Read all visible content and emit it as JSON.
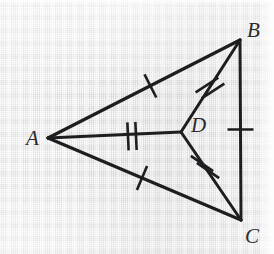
{
  "figure": {
    "kind": "geometry-diagram",
    "width": 274,
    "height": 254,
    "background_color": "#ececed",
    "stroke_color": "#1e1e21",
    "label_color": "#2b2b2e"
  },
  "points": {
    "A": {
      "label": "A",
      "x": 48,
      "y": 138,
      "label_x": 26,
      "label_y": 128
    },
    "B": {
      "label": "B",
      "x": 240,
      "y": 40,
      "label_x": 247,
      "label_y": 20
    },
    "C": {
      "label": "C",
      "x": 241,
      "y": 220,
      "label_x": 245,
      "label_y": 226
    },
    "D": {
      "label": "D",
      "x": 181,
      "y": 132,
      "label_x": 191,
      "label_y": 115
    }
  },
  "segments": [
    {
      "name": "AB",
      "from": "A",
      "to": "B",
      "x1": 48,
      "y1": 138,
      "x2": 240,
      "y2": 40,
      "ticks": 1,
      "tick_style": "perpendicular"
    },
    {
      "name": "AC",
      "from": "A",
      "to": "C",
      "x1": 48,
      "y1": 138,
      "x2": 241,
      "y2": 220,
      "ticks": 1,
      "tick_style": "perpendicular"
    },
    {
      "name": "AD",
      "from": "A",
      "to": "D",
      "x1": 48,
      "y1": 138,
      "x2": 181,
      "y2": 132,
      "ticks": 2,
      "tick_style": "perpendicular"
    },
    {
      "name": "BD",
      "from": "B",
      "to": "D",
      "x1": 240,
      "y1": 40,
      "x2": 181,
      "y2": 132,
      "ticks": 2,
      "tick_style": "perpendicular"
    },
    {
      "name": "DC",
      "from": "D",
      "to": "C",
      "x1": 181,
      "y1": 132,
      "x2": 241,
      "y2": 220,
      "ticks": 2,
      "tick_style": "perpendicular"
    },
    {
      "name": "BC",
      "from": "B",
      "to": "C",
      "x1": 240,
      "y1": 40,
      "x2": 241,
      "y2": 220,
      "ticks": 1,
      "tick_style": "perpendicular"
    }
  ],
  "tick_marks": [
    {
      "on": "AB",
      "index": 1,
      "cx": 150.4,
      "cy": 85.9,
      "angle_deg": -27.0,
      "length": 26
    },
    {
      "on": "AC",
      "index": 1,
      "cx": 142.0,
      "cy": 178.0,
      "angle_deg": 23.0,
      "length": 26
    },
    {
      "on": "AD",
      "index": 1,
      "cx": 128.0,
      "cy": 136.4,
      "angle_deg": -2.6,
      "length": 28
    },
    {
      "on": "AD",
      "index": 2,
      "cx": 136.0,
      "cy": 136.0,
      "angle_deg": -2.6,
      "length": 28
    },
    {
      "on": "BD",
      "index": 1,
      "cx": 207.0,
      "cy": 85.0,
      "angle_deg": 57.3,
      "length": 27
    },
    {
      "on": "BD",
      "index": 2,
      "cx": 213.0,
      "cy": 91.0,
      "angle_deg": 57.3,
      "length": 27
    },
    {
      "on": "DC",
      "index": 1,
      "cx": 202.0,
      "cy": 163.5,
      "angle_deg": -55.7,
      "length": 27
    },
    {
      "on": "DC",
      "index": 2,
      "cx": 208.0,
      "cy": 170.5,
      "angle_deg": -55.7,
      "length": 27
    },
    {
      "on": "BC",
      "index": 1,
      "cx": 240.5,
      "cy": 129.5,
      "angle_deg": 90.3,
      "length": 26
    }
  ],
  "congruence_notes": {
    "single_tick_group": [
      "AB",
      "AC",
      "BC"
    ],
    "double_tick_group": [
      "AD",
      "BD",
      "DC"
    ]
  }
}
